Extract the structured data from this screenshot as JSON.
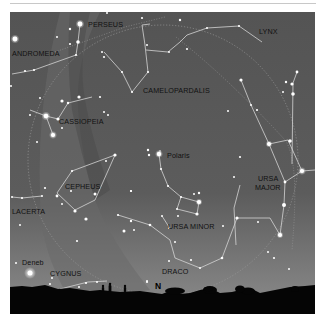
{
  "chart": {
    "colors": {
      "sky_top": "#555555",
      "sky_bottom": "#8a8a8a",
      "milky_way": "#6a6a6a",
      "lines": "#d8d8d8",
      "stars": "#ffffff",
      "ground": "#050505",
      "label": "#111111"
    },
    "constellations": [
      {
        "name": "PERSEUS",
        "label": "PERSEUS",
        "x": 88,
        "y": 26
      },
      {
        "name": "ANDROMEDA",
        "label": "ANDROMEDA",
        "x": 12,
        "y": 55
      },
      {
        "name": "LYNX",
        "label": "LYNX",
        "x": 258,
        "y": 33
      },
      {
        "name": "CAMELOPARDALIS",
        "label": "CAMELOPARDALIS",
        "x": 145,
        "y": 92
      },
      {
        "name": "CASSIOPEIA",
        "label": "CASSIOPEIA",
        "x": 59,
        "y": 123
      },
      {
        "name": "CEPHEUS",
        "label": "CEPHEUS",
        "x": 65,
        "y": 189
      },
      {
        "name": "URSA MAJOR",
        "label_line1": "URSA",
        "label_line2": "MAJOR",
        "x": 259,
        "y": 181
      },
      {
        "name": "URSA MINOR",
        "label": "URSA MINOR",
        "x": 168,
        "y": 229
      },
      {
        "name": "LACERTA",
        "label": "LACERTA",
        "x": 12,
        "y": 214
      },
      {
        "name": "CYGNUS",
        "label": "CYGNUS",
        "x": 50,
        "y": 276
      },
      {
        "name": "DRACO",
        "label": "DRACO",
        "x": 162,
        "y": 274
      }
    ],
    "named_stars": [
      {
        "name": "Polaris",
        "x": 167,
        "y": 157
      },
      {
        "name": "Deneb",
        "x": 22,
        "y": 264
      }
    ],
    "compass": {
      "label": "N",
      "x": 157,
      "y": 286
    }
  }
}
